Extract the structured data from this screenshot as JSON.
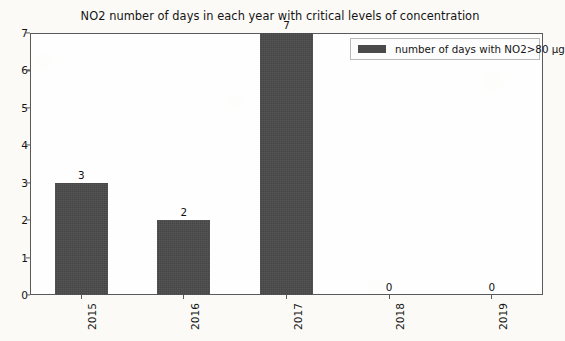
{
  "chart_data": {
    "type": "bar",
    "title": "NO2 number of days in each year with critical levels of concentration",
    "categories": [
      "2015",
      "2016",
      "2017",
      "2018",
      "2019"
    ],
    "values": [
      3,
      2,
      7,
      0,
      0
    ],
    "value_labels": [
      "3",
      "2",
      "7",
      "0",
      "0"
    ],
    "series": [
      {
        "name": "number of days with NO2>80 µg",
        "values": [
          3,
          2,
          7,
          0,
          0
        ]
      }
    ],
    "xlabel": "",
    "ylabel": "",
    "ylim": [
      0,
      7
    ],
    "yticks": [
      0,
      1,
      2,
      3,
      4,
      5,
      6,
      7
    ],
    "ytick_labels": [
      "0",
      "1",
      "2",
      "3",
      "4",
      "5",
      "6",
      "7"
    ],
    "grid": false,
    "legend": {
      "position": "upper right",
      "entries": [
        "number of days with NO2>80 µg"
      ]
    },
    "xtick_rotation": 90,
    "colors": {
      "bar": "#4a4a4a",
      "axis": "#5a5a5a",
      "text": "#141414",
      "plot_background": "#ffffff",
      "page_background": "#fbfaf7"
    }
  }
}
